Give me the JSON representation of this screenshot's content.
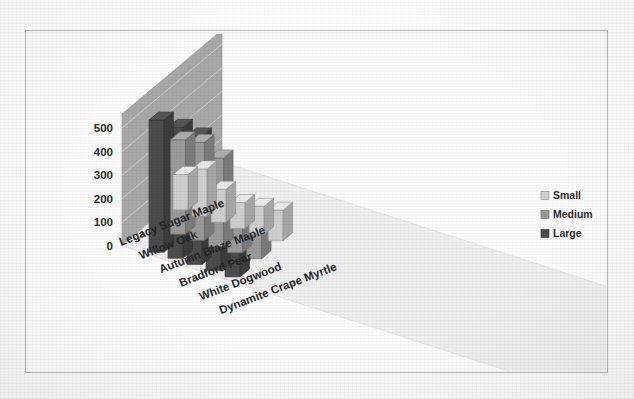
{
  "chart_data": {
    "type": "bar",
    "title": "",
    "subtitle": "",
    "xlabel": "",
    "ylabel": "",
    "three_d": true,
    "grid": true,
    "legend_position": "right",
    "ylim": [
      0,
      500
    ],
    "yticks": [
      0,
      100,
      200,
      300,
      400,
      500
    ],
    "ytick_labels": [
      "0",
      "100",
      "200",
      "300",
      "400",
      "500"
    ],
    "categories": [
      "Legacy Sugar Maple",
      "Willow Oak",
      "Autumn Blaze Maple",
      "Bradford Pear",
      "White Dogwood",
      "Dynamite Crape Myrtle"
    ],
    "series": [
      {
        "name": "Small",
        "color": "#cfcfcf",
        "values": [
          150,
          200,
          140,
          110,
          120,
          130
        ]
      },
      {
        "name": "Medium",
        "color": "#9a9a9a",
        "values": [
          0,
          400,
          415,
          375,
          165,
          150
        ]
      },
      {
        "name": "Large",
        "color": "#4c4c4c",
        "values": [
          0,
          560,
          555,
          545,
          210,
          195
        ]
      }
    ]
  },
  "legend": {
    "items": [
      {
        "label": "Small",
        "color": "#cfcfcf"
      },
      {
        "label": "Medium",
        "color": "#9a9a9a"
      },
      {
        "label": "Large",
        "color": "#4c4c4c"
      }
    ]
  },
  "colors": {
    "small": "#cfcfcf",
    "medium": "#9a9a9a",
    "large": "#4c4c4c",
    "back_wall": "#a8a8a8",
    "side_wall": "#b5b5b5",
    "floor": "#efefef",
    "frame_border": "#b9b9b9",
    "text": "#2b2b2b",
    "page_background": "#fdfdfd"
  }
}
